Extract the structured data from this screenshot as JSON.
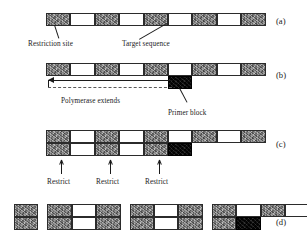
{
  "figure": {
    "panels": [
      {
        "id": "a",
        "label": "(a)"
      },
      {
        "id": "b",
        "label": "(b)"
      },
      {
        "id": "c",
        "label": "(c)"
      },
      {
        "id": "d",
        "label": "(d)"
      }
    ]
  },
  "labels": {
    "restriction_site": "Restriction site",
    "target_sequence": "Target sequence",
    "polymerase_extends": "Polymerase extends",
    "primer_block": "Primer block",
    "restrict_1": "Restrict",
    "restrict_2": "Restrict",
    "restrict_3": "Restrict"
  },
  "colors": {
    "dark_segment": "#8a8a8a",
    "light_segment": "#ffffff",
    "primer_block": "#090909",
    "outline": "#2b2b2b",
    "text": "#1a1a1a",
    "dashed_line": "#5a5a5a"
  },
  "panel_a": {
    "strand_top": [
      "dark",
      "light",
      "dark",
      "light",
      "dark",
      "light",
      "dark",
      "light",
      "dark"
    ]
  },
  "panel_b": {
    "strand_top": [
      "dark",
      "light",
      "dark",
      "light",
      "dark",
      "light",
      "dark",
      "light",
      "dark"
    ],
    "strand_bottom": [
      "blank",
      "blank",
      "blank",
      "blank",
      "blank",
      "black"
    ],
    "arrow_direction": "left",
    "arrow_text": "Polymerase extends"
  },
  "panel_c": {
    "strand_top": [
      "dark",
      "light",
      "dark",
      "light",
      "dark",
      "light",
      "dark",
      "light",
      "dark"
    ],
    "strand_bottom": [
      "dark",
      "light",
      "dark",
      "light",
      "dark",
      "black"
    ],
    "cut_positions": [
      1,
      3,
      5
    ]
  },
  "panel_d": {
    "fragments": [
      {
        "top": [
          "dark"
        ],
        "bottom": [
          "dark"
        ]
      },
      {
        "top": [
          "dark",
          "light",
          "dark"
        ],
        "bottom": [
          "dark",
          "light",
          "dark"
        ]
      },
      {
        "top": [
          "dark",
          "light",
          "dark"
        ],
        "bottom": [
          "dark",
          "light",
          "dark"
        ]
      },
      {
        "top": [
          "dark",
          "light",
          "dark",
          "light",
          "dark"
        ],
        "bottom": [
          "dark",
          "black"
        ]
      }
    ]
  }
}
